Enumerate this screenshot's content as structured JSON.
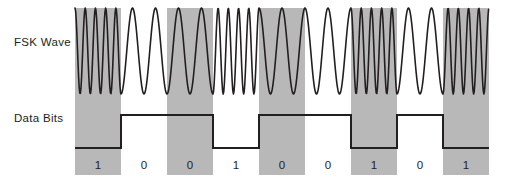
{
  "labels": {
    "fsk_wave": "FSK Wave",
    "data_bits": "Data Bits"
  },
  "colors": {
    "band_gray": "#b8b8b8",
    "ink": "#231f20",
    "background": "#ffffff"
  },
  "chart_data": {
    "type": "line",
    "title": "",
    "xlabel": "",
    "ylabel": "",
    "grid": false,
    "legend_position": "none",
    "bit_sequence": [
      1,
      0,
      0,
      1,
      0,
      0,
      1,
      0,
      1
    ],
    "bit_labels": [
      "1",
      "0",
      "0",
      "1",
      "0",
      "0",
      "1",
      "0",
      "1"
    ],
    "bit_count": 9,
    "bit_cell_width_px": 46,
    "plot_left_px": 75,
    "plot_right_px": 489,
    "shading": {
      "note": "Alternating vertical gray bands mark every other bit cell, starting with the first cell.",
      "shaded_cell_indices": [
        0,
        2,
        4,
        6,
        8
      ],
      "band_top_px": 8,
      "band_bottom_px": 175
    },
    "fsk_wave": {
      "series_name": "FSK Wave",
      "baseline_y_px": 51,
      "amplitude_px": 43,
      "top_y_px": 8,
      "bottom_y_px": 95,
      "high_frequency_cycles_per_cell": 4.5,
      "low_frequency_cycles_per_cell": 2.0,
      "cycles_per_cell": [
        4.5,
        2.0,
        2.0,
        4.5,
        2.0,
        2.0,
        4.5,
        2.0,
        4.5
      ],
      "note": "High frequency bursts coincide with the shaded bands; low frequency bursts coincide with the white gaps."
    },
    "data_bits_wave": {
      "series_name": "Data Bits",
      "logic": "inverted",
      "high_level_y_px": 115,
      "low_level_y_px": 148,
      "level_per_cell": [
        "low",
        "high",
        "high",
        "low",
        "high",
        "high",
        "low",
        "high",
        "low"
      ],
      "note": "The digital trace sits at its LOW level during bits valued 1 and at its HIGH level during bits valued 0."
    }
  }
}
